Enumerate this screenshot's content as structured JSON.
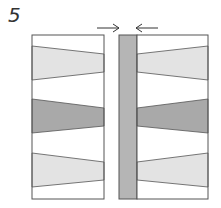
{
  "diagram": {
    "step_label": "5",
    "colors": {
      "outline": "#555555",
      "band_light": "#e3e3e3",
      "band_dark": "#a9a9a9",
      "strip": "#b5b5b5",
      "background": "#ffffff",
      "arrow": "#333333"
    },
    "left_panel": {
      "x1": 32,
      "x2": 104,
      "top": 35,
      "bottom": 199
    },
    "strip": {
      "x1": 119,
      "x2": 137,
      "top": 35,
      "bottom": 199
    },
    "right_panel": {
      "x1": 137,
      "x2": 208,
      "top": 35,
      "bottom": 199
    },
    "bands": [
      {
        "name": "top-light-band",
        "shade": "band_light",
        "outer_top": 46,
        "outer_bottom": 80,
        "inner_top": 54,
        "inner_bottom": 72
      },
      {
        "name": "middle-dark-band",
        "shade": "band_dark",
        "outer_top": 99,
        "outer_bottom": 133,
        "inner_top": 108,
        "inner_bottom": 126
      },
      {
        "name": "bottom-light-band",
        "shade": "band_light",
        "outer_top": 153,
        "outer_bottom": 187,
        "inner_top": 162,
        "inner_bottom": 180
      }
    ],
    "arrows": [
      {
        "name": "arrow-pointing-right",
        "from_x": 97,
        "to_x": 119,
        "y": 28
      },
      {
        "name": "arrow-pointing-left",
        "from_x": 158,
        "to_x": 136,
        "y": 28
      }
    ]
  }
}
